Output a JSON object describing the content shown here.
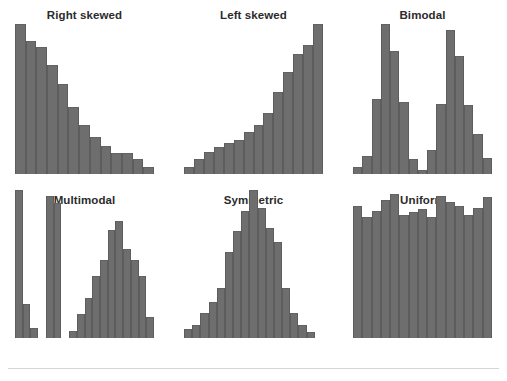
{
  "figure": {
    "background": "#ffffff",
    "bar_color": "#6e6e6e",
    "bar_edge_color": "#5d5d5d",
    "title_color": "#2b2b2b",
    "rule_color": "#d5d5d5"
  },
  "panels": [
    {
      "title": "Right skewed",
      "position": "row1-col1"
    },
    {
      "title": "Left skewed",
      "position": "row1-col2"
    },
    {
      "title": "Bimodal",
      "position": "row1-col3"
    },
    {
      "title": "Multimodal",
      "position": "row2-col1"
    },
    {
      "title": "Symmetric",
      "position": "row2-col2"
    },
    {
      "title": "Uniform",
      "position": "row2-col3"
    }
  ],
  "chart_data": [
    {
      "type": "bar",
      "title": "Right skewed",
      "xlabel": "",
      "ylabel": "",
      "grid": false,
      "legend": "none",
      "ylim": [
        0,
        100
      ],
      "categories": [
        "1",
        "2",
        "3",
        "4",
        "5",
        "6",
        "7",
        "8",
        "9",
        "10",
        "11",
        "12",
        "13"
      ],
      "values": [
        100,
        89,
        85,
        73,
        60,
        45,
        33,
        25,
        19,
        14,
        14,
        10,
        5
      ]
    },
    {
      "type": "bar",
      "title": "Left skewed",
      "xlabel": "",
      "ylabel": "",
      "grid": false,
      "legend": "none",
      "ylim": [
        0,
        100
      ],
      "categories": [
        "1",
        "2",
        "3",
        "4",
        "5",
        "6",
        "7",
        "8",
        "9",
        "10",
        "11",
        "12",
        "13",
        "14"
      ],
      "values": [
        5,
        10,
        15,
        18,
        21,
        23,
        28,
        33,
        41,
        55,
        68,
        80,
        86,
        100
      ]
    },
    {
      "type": "bar",
      "title": "Bimodal",
      "xlabel": "",
      "ylabel": "",
      "grid": false,
      "legend": "none",
      "ylim": [
        0,
        100
      ],
      "categories": [
        "1",
        "2",
        "3",
        "4",
        "5",
        "6",
        "7",
        "8",
        "9",
        "10",
        "11",
        "12",
        "13",
        "14",
        "15"
      ],
      "values": [
        5,
        12,
        50,
        100,
        82,
        48,
        10,
        3,
        16,
        47,
        96,
        79,
        46,
        27,
        11
      ]
    },
    {
      "type": "bar",
      "title": "Multimodal",
      "xlabel": "",
      "ylabel": "",
      "grid": false,
      "legend": "none",
      "ylim": [
        0,
        100
      ],
      "categories": [
        "1",
        "2",
        "3",
        "4",
        "5",
        "6",
        "7",
        "8",
        "9",
        "10",
        "11",
        "12",
        "13",
        "14",
        "15",
        "16"
      ],
      "values": [
        100,
        23,
        7,
        0,
        96,
        91,
        0,
        5,
        16,
        27,
        42,
        53,
        73,
        79,
        60,
        53
      ],
      "values_tail": [
        42,
        14
      ]
    },
    {
      "type": "bar",
      "title": "Symmetric",
      "xlabel": "",
      "ylabel": "",
      "grid": false,
      "legend": "none",
      "ylim": [
        0,
        100
      ],
      "categories": [
        "1",
        "2",
        "3",
        "4",
        "5",
        "6",
        "7",
        "8",
        "9",
        "10",
        "11",
        "12",
        "13",
        "14",
        "15",
        "16",
        "17"
      ],
      "values": [
        6,
        9,
        17,
        24,
        34,
        58,
        72,
        86,
        100,
        88,
        74,
        65,
        34,
        17,
        9,
        4,
        0
      ]
    },
    {
      "type": "bar",
      "title": "Uniform",
      "xlabel": "",
      "ylabel": "",
      "grid": false,
      "legend": "none",
      "ylim": [
        0,
        100
      ],
      "categories": [
        "1",
        "2",
        "3",
        "4",
        "5",
        "6",
        "7",
        "8",
        "9",
        "10",
        "11",
        "12",
        "13",
        "14",
        "15"
      ],
      "values": [
        89,
        82,
        86,
        93,
        97,
        83,
        85,
        87,
        82,
        96,
        92,
        89,
        83,
        88,
        95
      ]
    }
  ]
}
